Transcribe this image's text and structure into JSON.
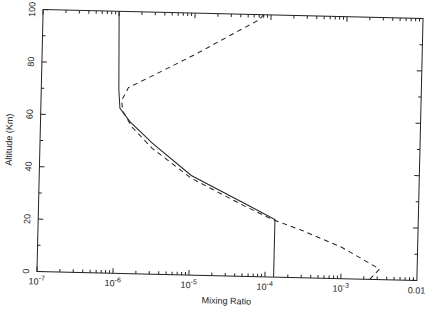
{
  "chart_data": {
    "type": "line",
    "title": "",
    "xlabel": "Mixing Ratio",
    "ylabel": "Altitude (Km)",
    "xscale": "log",
    "xlim": [
      1e-07,
      0.01
    ],
    "ylim": [
      0,
      100
    ],
    "x_tick_labels": [
      {
        "value": 1e-07,
        "base": "10",
        "exp": "-7"
      },
      {
        "value": 1e-06,
        "base": "10",
        "exp": "-6"
      },
      {
        "value": 1e-05,
        "base": "10",
        "exp": "-5"
      },
      {
        "value": 0.0001,
        "base": "10",
        "exp": "-4"
      },
      {
        "value": 0.001,
        "base": "10",
        "exp": "-3"
      },
      {
        "value": 0.01,
        "base": "0.01",
        "exp": ""
      }
    ],
    "y_ticks": [
      0,
      20,
      40,
      60,
      80,
      100
    ],
    "grid": false,
    "legend": null,
    "series": [
      {
        "name": "solid",
        "style": "solid",
        "points": [
          [
            0.00013,
            0
          ],
          [
            0.00013,
            22
          ],
          [
            5e-05,
            28
          ],
          [
            1e-05,
            38
          ],
          [
            3e-06,
            50
          ],
          [
            1.5e-06,
            58
          ],
          [
            1.1e-06,
            63
          ],
          [
            1.05e-06,
            70
          ],
          [
            1e-06,
            100
          ]
        ]
      },
      {
        "name": "dashed",
        "style": "dashed",
        "points": [
          [
            0.0024,
            0
          ],
          [
            0.0032,
            4
          ],
          [
            0.001,
            12
          ],
          [
            0.0003,
            18
          ],
          [
            0.00012,
            22
          ],
          [
            5e-05,
            27
          ],
          [
            1e-05,
            37
          ],
          [
            3e-06,
            48
          ],
          [
            1.6e-06,
            56
          ],
          [
            1.2e-06,
            62
          ],
          [
            1.15e-06,
            66
          ],
          [
            1.4e-06,
            71
          ],
          [
            3e-06,
            76
          ],
          [
            1e-05,
            84
          ],
          [
            3e-05,
            92
          ],
          [
            7e-05,
            98
          ],
          [
            8e-05,
            100
          ]
        ]
      }
    ]
  }
}
